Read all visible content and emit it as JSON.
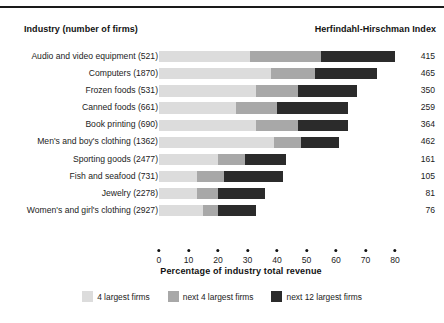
{
  "figure": {
    "top_caption": "(cut-off caption strip)",
    "industry_header": "Industry (number of firms)",
    "hhi_header": "Herfindahl-Hirschman Index"
  },
  "colors": {
    "seg_light": "#dcdcdc",
    "seg_medium": "#a8a8a8",
    "seg_dark": "#2b2b2b",
    "text": "#1c1c1c",
    "rule": "#1a1a1a"
  },
  "chart_data": {
    "type": "bar",
    "title": "",
    "xlabel": "Percentage of industry total revenue",
    "ylabel": "",
    "xlim": [
      0,
      80
    ],
    "xticks": [
      0,
      10,
      20,
      30,
      40,
      50,
      60,
      70,
      80
    ],
    "xtick_labels": [
      "0",
      "10",
      "20",
      "30",
      "40",
      "50",
      "60",
      "70",
      "80"
    ],
    "grid": false,
    "stacked": true,
    "legend_position": "bottom",
    "categories": [
      "Audio and video equipment  (521)",
      "Computers  (1870)",
      "Frozen foods  (531)",
      "Canned foods  (661)",
      "Book printing  (690)",
      "Men's and boy's clothing  (1362)",
      "Sporting goods  (2477)",
      "Fish and seafood  (731)",
      "Jewelry  (2278)",
      "Women's and girl's clothing  (2927)"
    ],
    "series": [
      {
        "name": "4 largest firms",
        "color": "#dcdcdc",
        "values": [
          31,
          38,
          33,
          26,
          33,
          39,
          20,
          13,
          13,
          15
        ]
      },
      {
        "name": "next 4 largest firms",
        "color": "#a8a8a8",
        "values": [
          24,
          15,
          14,
          14,
          14,
          9,
          9,
          9,
          7,
          5
        ]
      },
      {
        "name": "next 12 largest firms",
        "color": "#2b2b2b",
        "values": [
          25,
          21,
          20,
          24,
          17,
          13,
          14,
          20,
          16,
          13
        ]
      }
    ],
    "annotations": {
      "hhi_label": "Herfindahl-Hirschman Index",
      "hhi_values": [
        415,
        465,
        350,
        259,
        364,
        462,
        161,
        105,
        81,
        76
      ]
    }
  }
}
